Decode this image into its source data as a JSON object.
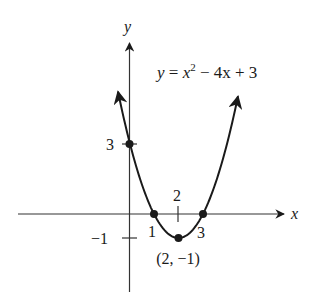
{
  "chart_data": {
    "type": "line",
    "title": "",
    "equation": "y = x² − 4x + 3",
    "equation_parts": {
      "lhs": "y",
      "eq": " = ",
      "x": "x",
      "exp": "2",
      "rest": " − 4x + 3"
    },
    "xlabel": "x",
    "ylabel": "y",
    "xlim": [
      -4.6,
      6.4
    ],
    "ylim": [
      -3.2,
      7.4
    ],
    "grid": false,
    "legend": "none",
    "series": [
      {
        "name": "y = x^2 - 4x + 3",
        "function": "x^2 - 4x + 3",
        "x_range": [
          -0.47,
          4.43
        ],
        "arrows_at_ends": true,
        "x": [
          -0.47,
          0,
          0.5,
          1,
          1.5,
          2,
          2.5,
          3,
          3.5,
          4,
          4.43
        ],
        "y": [
          5.1,
          3,
          1.25,
          0,
          -0.75,
          -1,
          -0.75,
          0,
          1.25,
          3,
          4.9
        ]
      }
    ],
    "marked_points": [
      {
        "x": 0,
        "y": 3,
        "label": "3"
      },
      {
        "x": 1,
        "y": 0,
        "label": "1"
      },
      {
        "x": 3,
        "y": 0,
        "label": "3"
      },
      {
        "x": 2,
        "y": -1,
        "label": "(2, −1)"
      }
    ],
    "tick_labels": {
      "x": [
        {
          "value": 1,
          "label": "1"
        },
        {
          "value": 2,
          "label": "2"
        },
        {
          "value": 3,
          "label": "3"
        }
      ],
      "y": [
        {
          "value": 3,
          "label": "3"
        },
        {
          "value": -1,
          "label": "−1"
        }
      ]
    },
    "annotations": [
      "y = x² − 4x + 3",
      "(2, −1)"
    ],
    "colors": {
      "ink": "#1a1a1a",
      "axis": "#333333",
      "background": "#ffffff"
    }
  }
}
